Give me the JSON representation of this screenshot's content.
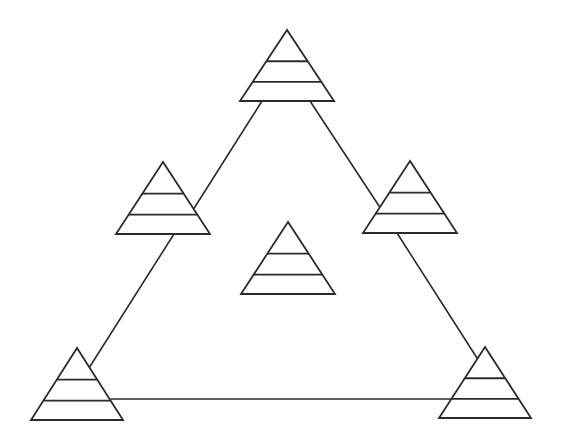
{
  "diagram": {
    "title": "",
    "background": "#ffffff",
    "stroke_color": "#2b2b2b",
    "canvas": {
      "width": 564,
      "height": 447
    },
    "edges": [
      {
        "name": "edge-top-to-left-mid",
        "x1": 262,
        "y1": 101,
        "x2": 193,
        "y2": 210
      },
      {
        "name": "edge-left-mid-to-bottom-left",
        "x1": 174,
        "y1": 234,
        "x2": 89,
        "y2": 368
      },
      {
        "name": "edge-top-to-right-mid",
        "x1": 310,
        "y1": 101,
        "x2": 381,
        "y2": 209
      },
      {
        "name": "edge-right-mid-to-bottom-right",
        "x1": 397,
        "y1": 233,
        "x2": 477,
        "y2": 358
      },
      {
        "name": "edge-bottom",
        "x1": 111,
        "y1": 399,
        "x2": 452,
        "y2": 399
      }
    ],
    "pyramids": [
      {
        "name": "pyramid-top",
        "apex_x": 287,
        "apex_y": 30,
        "base_y": 101,
        "half_width": 47,
        "bands": 3
      },
      {
        "name": "pyramid-left-middle",
        "apex_x": 163,
        "apex_y": 162,
        "base_y": 234,
        "half_width": 47,
        "bands": 3
      },
      {
        "name": "pyramid-right-middle",
        "apex_x": 410,
        "apex_y": 161,
        "base_y": 233,
        "half_width": 47,
        "bands": 3
      },
      {
        "name": "pyramid-center",
        "apex_x": 288,
        "apex_y": 222,
        "base_y": 294,
        "half_width": 47,
        "bands": 3
      },
      {
        "name": "pyramid-bottom-left",
        "apex_x": 77,
        "apex_y": 348,
        "base_y": 420,
        "half_width": 46,
        "bands": 3
      },
      {
        "name": "pyramid-bottom-right",
        "apex_x": 485,
        "apex_y": 347,
        "base_y": 418,
        "half_width": 46,
        "bands": 3
      }
    ]
  }
}
